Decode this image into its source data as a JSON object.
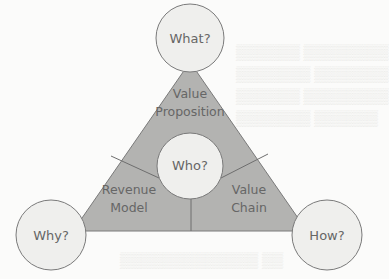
{
  "diagram": {
    "type": "business-model-triangle",
    "colors": {
      "triangle_fill": "#b3b3b1",
      "outline": "#7a7a7a",
      "circle_fill": "#efefed",
      "text": "#666666",
      "background": "#fbfbfa"
    },
    "circles": {
      "top": {
        "label": "What?"
      },
      "center": {
        "label": "Who?"
      },
      "left": {
        "label": "Why?"
      },
      "right": {
        "label": "How?"
      }
    },
    "segments": {
      "top": {
        "line1": "Value",
        "line2": "Proposition"
      },
      "left": {
        "line1": "Revenue",
        "line2": "Model"
      },
      "right": {
        "line1": "Value",
        "line2": "Chain"
      }
    }
  }
}
